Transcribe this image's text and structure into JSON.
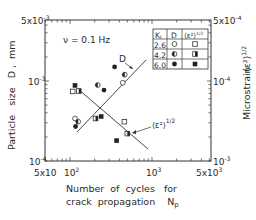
{
  "chart_data": {
    "type": "scatter",
    "title": "",
    "annotation_frequency": "ν = 0.1 Hz",
    "xlabel_line1": "Number  of  cycles   for",
    "xlabel_line2": "crack  propagation    N",
    "xlabel_sub": "p",
    "ylabel_left": "Particle   size   D ,  mm",
    "ylabel_right": "Microstrain",
    "ylabel_right_symbol": "⟨ε²⟩",
    "ylabel_right_exp": "1/2",
    "x_scale": "log",
    "xlim": [
      50,
      5000
    ],
    "x_ticks": [
      {
        "value": 50,
        "label_base": "5x10",
        "label_exp": ""
      },
      {
        "value": 100,
        "label_base": "10",
        "label_exp": "2"
      },
      {
        "value": 1000,
        "label_base": "10",
        "label_exp": "3"
      },
      {
        "value": 5000,
        "label_base": "5x10",
        "label_exp": "3"
      }
    ],
    "y_left_scale": "log",
    "y_left_lim": [
      0.0001,
      0.005
    ],
    "y_left_ticks": [
      {
        "value": 0.0001,
        "label_base": "10",
        "label_exp": "-4"
      },
      {
        "value": 0.001,
        "label_base": "10",
        "label_exp": "-3"
      },
      {
        "value": 0.005,
        "label_base": "5x10",
        "label_exp": "-3"
      }
    ],
    "y_right_ticks": [
      {
        "position": "bottom",
        "label_base": "10",
        "label_exp": "-3"
      },
      {
        "position": "middle",
        "label_base": "10",
        "label_exp": "-4"
      },
      {
        "position": "top",
        "label_base": "5x10",
        "label_exp": "-4"
      }
    ],
    "legend": {
      "headers": [
        "K",
        "D",
        "⟨ε²⟩"
      ],
      "header_sub": "I",
      "header_exp": "1/2",
      "rows": [
        {
          "K": "2.6",
          "D_marker": "open-circle",
          "eps_marker": "open-square"
        },
        {
          "K": "4.2",
          "D_marker": "half-circle",
          "eps_marker": "half-square"
        },
        {
          "K": "6.0",
          "D_marker": "filled-circle",
          "eps_marker": "filled-square"
        }
      ]
    },
    "line_labels": {
      "D": "D",
      "eps": "⟨ε²⟩",
      "eps_exp": "1/2"
    },
    "series": [
      {
        "name": "D (particle size, left axis)",
        "points": [
          {
            "K": 2.6,
            "N": 115,
            "D": 0.00034
          },
          {
            "K": 4.2,
            "N": 126,
            "D": 0.00031
          },
          {
            "K": 6.0,
            "N": 117,
            "D": 0.00027
          },
          {
            "K": 4.2,
            "N": 218,
            "D": 0.00089
          },
          {
            "K": 6.0,
            "N": 260,
            "D": 0.00077
          },
          {
            "K": 6.0,
            "N": 350,
            "D": 0.0015
          },
          {
            "K": 4.2,
            "N": 465,
            "D": 0.0012
          },
          {
            "K": 2.6,
            "N": 440,
            "D": 0.00095
          }
        ],
        "fit_line": [
          {
            "N": 105,
            "D": 0.00023
          },
          {
            "N": 720,
            "D": 0.0018
          }
        ]
      },
      {
        "name": "<eps^2>^1/2 (microstrain, right axis, plotted in same frame)",
        "points": [
          {
            "K": 6.0,
            "N": 115,
            "pos_D_equiv": 0.00088
          },
          {
            "K": 4.2,
            "N": 128,
            "pos_D_equiv": 0.00075
          },
          {
            "K": 2.6,
            "N": 108,
            "pos_D_equiv": 0.00074
          },
          {
            "K": 4.2,
            "N": 205,
            "pos_D_equiv": 0.00034
          },
          {
            "K": 6.0,
            "N": 240,
            "pos_D_equiv": 0.00036
          },
          {
            "K": 2.6,
            "N": 460,
            "pos_D_equiv": 0.00031
          },
          {
            "K": 4.2,
            "N": 500,
            "pos_D_equiv": 0.00022
          },
          {
            "K": 6.0,
            "N": 370,
            "pos_D_equiv": 0.00018
          }
        ],
        "fit_line": [
          {
            "N": 110,
            "pos_D_equiv": 0.00092
          },
          {
            "N": 740,
            "pos_D_equiv": 0.00017
          }
        ]
      }
    ],
    "grid": false,
    "legend_position": "upper right inside"
  }
}
